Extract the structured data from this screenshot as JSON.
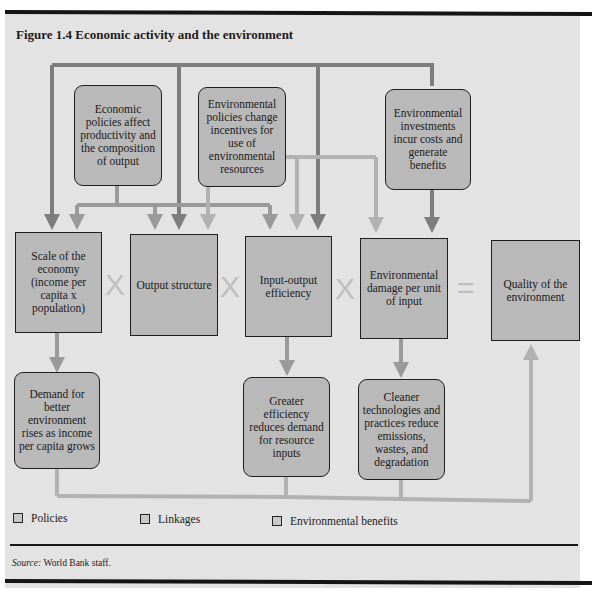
{
  "figure": {
    "title": "Figure 1.4  Economic activity and the environment"
  },
  "policies": [
    {
      "id": "economic-policies",
      "text": "Economic policies affect productivity and the composition of output"
    },
    {
      "id": "environmental-policies",
      "text": "Environmental policies change incentives for use of environmental resources"
    },
    {
      "id": "environmental-investments",
      "text": "Environmental investments incur costs and generate benefits"
    }
  ],
  "factors": [
    {
      "id": "scale",
      "text": "Scale of the economy (income per capita x population)"
    },
    {
      "id": "output-structure",
      "text": "Output structure"
    },
    {
      "id": "efficiency",
      "text": "Input-output efficiency"
    },
    {
      "id": "damage",
      "text": "Environmental damage per unit of input"
    },
    {
      "id": "quality",
      "text": "Quality of the environment"
    }
  ],
  "operators": [
    "X",
    "X",
    "X",
    "="
  ],
  "benefits": [
    {
      "id": "demand",
      "text": "Demand for better environment rises as income per capita grows"
    },
    {
      "id": "greater-efficiency",
      "text": "Greater efficiency reduces demand for resource inputs"
    },
    {
      "id": "cleaner-tech",
      "text": "Cleaner technologies and practices reduce emissions, wastes, and degradation"
    }
  ],
  "legend": [
    {
      "label": "Policies",
      "color": "#8c8c8c"
    },
    {
      "label": "Linkages",
      "color": "#b4b4b4"
    },
    {
      "label": "Environmental benefits",
      "color": "#c6c6c6"
    }
  ],
  "source": {
    "label": "Source:",
    "text": "World Bank staff."
  },
  "colors": {
    "panel": "#e3e3e3",
    "box": "#b9b9b9",
    "dark_arrow": "#7d7d7d",
    "mid_arrow": "#9a9a9a",
    "light_arrow": "#b2b2b2",
    "operator": "#bfbfbf"
  }
}
